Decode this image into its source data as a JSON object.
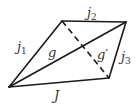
{
  "diagram": {
    "type": "graph",
    "nodes": [
      "A",
      "B",
      "C",
      "D"
    ],
    "edges": [
      {
        "id": "j1",
        "from": "A",
        "to": "B",
        "style": "solid",
        "label": {
          "base": "j",
          "sub": "1"
        }
      },
      {
        "id": "j2",
        "from": "B",
        "to": "C",
        "style": "solid",
        "label": {
          "base": "j",
          "sub": "2"
        }
      },
      {
        "id": "j3",
        "from": "C",
        "to": "D",
        "style": "solid",
        "label": {
          "base": "j",
          "sub": "3"
        }
      },
      {
        "id": "J",
        "from": "A",
        "to": "D",
        "style": "solid",
        "label": {
          "base": "J",
          "sub": ""
        }
      },
      {
        "id": "g",
        "from": "A",
        "to": "C",
        "style": "solid",
        "label": {
          "base": "g",
          "sub": ""
        }
      },
      {
        "id": "gp",
        "from": "B",
        "to": "D",
        "style": "dashed",
        "label": {
          "base": "g′",
          "sub": ""
        }
      }
    ],
    "colors": {
      "line": "#1a1a1a",
      "text": "#333333",
      "background": "#ffffff"
    }
  }
}
